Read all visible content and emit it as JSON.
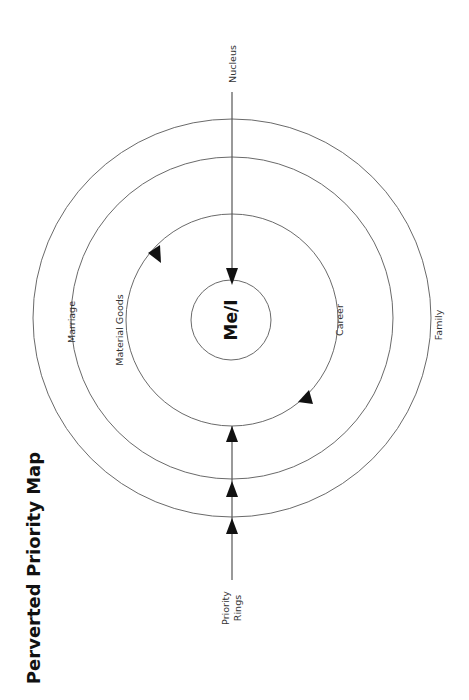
{
  "title": "Perverted Priority Map",
  "center_label": "Me/I",
  "rings": [
    {
      "label": "Career",
      "role": "inner ring"
    },
    {
      "label": "Material Goods",
      "role": "inner ring"
    },
    {
      "label": "Marriage",
      "role": "middle ring"
    },
    {
      "label": "Family",
      "role": "outer ring"
    }
  ],
  "axis_labels": {
    "top": "Nucleus",
    "bottom_line1": "Priority",
    "bottom_line2": "Rings"
  },
  "colors": {
    "ring_stroke": "#6a6a6a",
    "arrow_fill": "#111111",
    "text": "#333333",
    "background": "#ffffff"
  }
}
